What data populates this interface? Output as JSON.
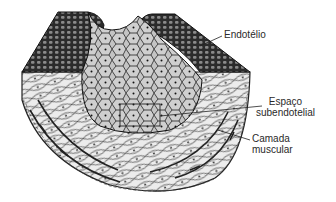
{
  "figure": {
    "colors": {
      "ink": "#1a1a1a",
      "cell_fill": "#c8c8c8",
      "muscle_fill": "#e8e8e8",
      "background": "#ffffff"
    }
  },
  "labels": {
    "endotelio": "Endotélio",
    "espaco_line1": "Espaço",
    "espaco_line2": "subendotelial",
    "camada_line1": "Camada",
    "camada_line2": "muscular"
  }
}
